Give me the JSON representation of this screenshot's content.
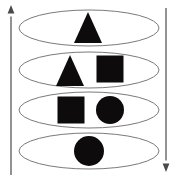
{
  "figure": {
    "title": "Stacked layer diagram with shape composition",
    "background_color": "#ffffff",
    "outline_color": "#6b6b6b",
    "shape_color": "#0d0b0b",
    "axis_color": "#6e6e6e",
    "width": 179,
    "height": 179
  },
  "axes": [
    {
      "id": "left-axis",
      "label": "",
      "direction": "up",
      "arrowhead": "top",
      "x": 11,
      "y_top": 5,
      "y_bottom": 175
    },
    {
      "id": "right-axis",
      "label": "",
      "direction": "down",
      "arrowhead": "bottom",
      "x": 166,
      "y_top": 8,
      "y_bottom": 172
    }
  ],
  "layers": [
    {
      "id": "layer-1",
      "index": 1,
      "cx": 89,
      "cy": 28,
      "rx": 70,
      "ry": 18,
      "shapes": [
        {
          "type": "triangle",
          "cx": 88,
          "cy": 27,
          "size": 28
        }
      ]
    },
    {
      "id": "layer-2",
      "index": 2,
      "cx": 89,
      "cy": 70,
      "rx": 70,
      "ry": 18,
      "shapes": [
        {
          "type": "triangle",
          "cx": 70,
          "cy": 70,
          "size": 28
        },
        {
          "type": "square",
          "cx": 110,
          "cy": 69,
          "size": 27
        }
      ]
    },
    {
      "id": "layer-3",
      "index": 3,
      "cx": 89,
      "cy": 110,
      "rx": 70,
      "ry": 18,
      "shapes": [
        {
          "type": "square",
          "cx": 71,
          "cy": 110,
          "size": 27
        },
        {
          "type": "circle",
          "cx": 110,
          "cy": 110,
          "size": 28
        }
      ]
    },
    {
      "id": "layer-4",
      "index": 4,
      "cx": 89,
      "cy": 151,
      "rx": 70,
      "ry": 18,
      "shapes": [
        {
          "type": "circle",
          "cx": 89,
          "cy": 151,
          "size": 30
        }
      ]
    }
  ],
  "caption": ""
}
